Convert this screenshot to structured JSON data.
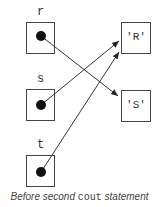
{
  "variables": [
    {
      "name": "r",
      "points_to": "S"
    },
    {
      "name": "s",
      "points_to": "R"
    },
    {
      "name": "t",
      "points_to": "R"
    }
  ],
  "values": [
    {
      "label": "'R'"
    },
    {
      "label": "'S'"
    }
  ],
  "caption": {
    "before": "Before second ",
    "code": "cout",
    "after": " statement"
  }
}
